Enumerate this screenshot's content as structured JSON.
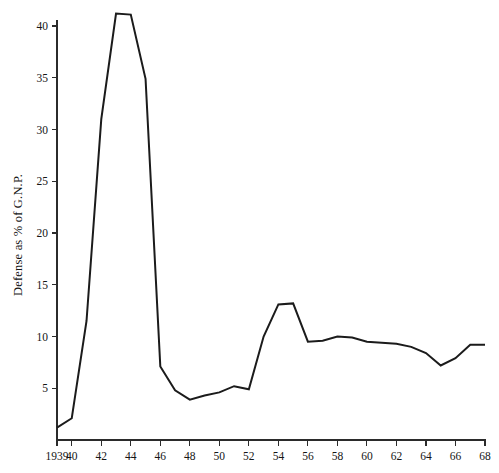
{
  "chart_data": {
    "type": "line",
    "title": "",
    "subtitle": "",
    "xlabel": "",
    "ylabel": "Defense as % of G.N.P.",
    "xlim": [
      1939,
      1968
    ],
    "ylim": [
      0,
      42
    ],
    "grid": false,
    "legend": "none",
    "line_color": "#1b1b1b",
    "axis_color": "#2b2b2b",
    "x_tick_labels": [
      "1939",
      "40",
      "42",
      "44",
      "46",
      "48",
      "50",
      "52",
      "54",
      "56",
      "58",
      "60",
      "62",
      "64",
      "66",
      "68"
    ],
    "x_tick_values": [
      1939,
      1940,
      1942,
      1944,
      1946,
      1948,
      1950,
      1952,
      1954,
      1956,
      1958,
      1960,
      1962,
      1964,
      1966,
      1968
    ],
    "y_tick_labels": [
      "5",
      "10",
      "15",
      "20",
      "25",
      "30",
      "35",
      "40"
    ],
    "y_tick_values": [
      5,
      10,
      15,
      20,
      25,
      30,
      35,
      40
    ],
    "x": [
      1939,
      1940,
      1941,
      1942,
      1943,
      1944,
      1945,
      1946,
      1947,
      1948,
      1949,
      1950,
      1951,
      1952,
      1953,
      1954,
      1955,
      1956,
      1957,
      1958,
      1959,
      1960,
      1961,
      1962,
      1963,
      1964,
      1965,
      1966,
      1967,
      1968
    ],
    "values": [
      1.2,
      2.1,
      11.5,
      31.0,
      41.2,
      41.1,
      34.9,
      7.1,
      4.8,
      3.9,
      4.3,
      4.6,
      5.2,
      4.9,
      10.0,
      13.1,
      13.2,
      9.5,
      9.6,
      10.0,
      9.9,
      9.5,
      9.4,
      9.3,
      9.0,
      8.4,
      7.2,
      7.9,
      9.2,
      9.2
    ],
    "series": [
      {
        "name": "Defense as % of G.N.P.",
        "values": [
          1.2,
          2.1,
          11.5,
          31.0,
          41.2,
          41.1,
          34.9,
          7.1,
          4.8,
          3.9,
          4.3,
          4.6,
          5.2,
          4.9,
          10.0,
          13.1,
          13.2,
          9.5,
          9.6,
          10.0,
          9.9,
          9.5,
          9.4,
          9.3,
          9.0,
          8.4,
          7.2,
          7.9,
          9.2,
          9.2
        ]
      }
    ],
    "annotations": []
  }
}
